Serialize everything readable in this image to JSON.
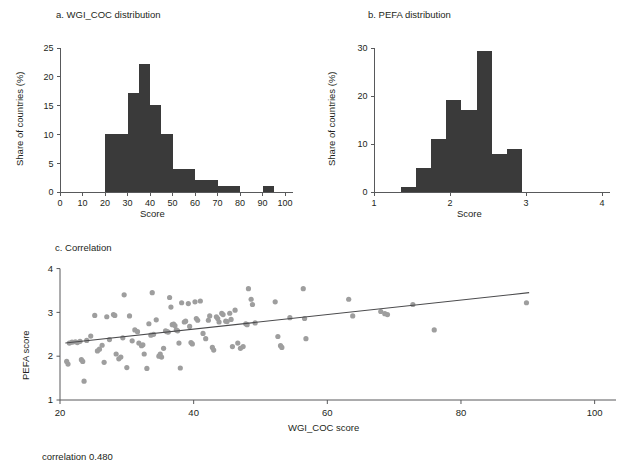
{
  "figure": {
    "caption": "correlation 0.480"
  },
  "panel_a": {
    "title": "a. WGI_COC distribution",
    "xlabel": "Score",
    "ylabel": "Share of countries (%)",
    "xticks": [
      "0",
      "10",
      "20",
      "30",
      "40",
      "50",
      "60",
      "70",
      "80",
      "90",
      "100"
    ],
    "yticks": [
      "0",
      "5",
      "10",
      "15",
      "20",
      "25"
    ]
  },
  "panel_b": {
    "title": "b. PEFA distribution",
    "xlabel": "Score",
    "ylabel": "Share of countries (%)",
    "xticks": [
      "1",
      "2",
      "3",
      "4"
    ],
    "yticks": [
      "0",
      "10",
      "20",
      "30"
    ]
  },
  "panel_c": {
    "title": "c. Correlation",
    "xlabel": "WGI_COC score",
    "ylabel": "PEFA score",
    "xticks": [
      "20",
      "40",
      "60",
      "80",
      "100"
    ],
    "yticks": [
      "1",
      "2",
      "3",
      "4"
    ]
  },
  "colors": {
    "bar": "#3a3a3a",
    "dot": "#9e9e9e",
    "line": "#4b4b4d",
    "axis": "#58595b",
    "text": "#231f20"
  },
  "chart_data": [
    {
      "type": "bar",
      "id": "a",
      "title": "a. WGI_COC distribution",
      "xlabel": "Score",
      "ylabel": "Share of countries (%)",
      "xlim": [
        0,
        100
      ],
      "ylim": [
        0,
        25
      ],
      "bin_width": 5,
      "grid": false,
      "bins": [
        {
          "x0": 20,
          "x1": 25,
          "value": 10.0
        },
        {
          "x0": 25,
          "x1": 30,
          "value": 10.0
        },
        {
          "x0": 30,
          "x1": 35,
          "value": 17.2
        },
        {
          "x0": 35,
          "x1": 40,
          "value": 22.2
        },
        {
          "x0": 40,
          "x1": 45,
          "value": 15.1
        },
        {
          "x0": 45,
          "x1": 50,
          "value": 10.0
        },
        {
          "x0": 50,
          "x1": 55,
          "value": 4.0
        },
        {
          "x0": 55,
          "x1": 60,
          "value": 4.0
        },
        {
          "x0": 60,
          "x1": 65,
          "value": 2.0
        },
        {
          "x0": 65,
          "x1": 70,
          "value": 2.0
        },
        {
          "x0": 70,
          "x1": 75,
          "value": 1.0
        },
        {
          "x0": 75,
          "x1": 80,
          "value": 1.0
        },
        {
          "x0": 90,
          "x1": 95,
          "value": 1.0
        }
      ]
    },
    {
      "type": "bar",
      "id": "b",
      "title": "b. PEFA distribution",
      "xlabel": "Score",
      "ylabel": "Share of countries (%)",
      "xlim": [
        1,
        4
      ],
      "ylim": [
        0,
        30
      ],
      "bin_width": 0.2,
      "grid": false,
      "bins": [
        {
          "x0": 1.35,
          "x1": 1.55,
          "value": 1.0
        },
        {
          "x0": 1.55,
          "x1": 1.75,
          "value": 5.0
        },
        {
          "x0": 1.75,
          "x1": 1.95,
          "value": 11.0
        },
        {
          "x0": 1.95,
          "x1": 2.15,
          "value": 19.2
        },
        {
          "x0": 2.15,
          "x1": 2.35,
          "value": 17.1
        },
        {
          "x0": 2.35,
          "x1": 2.55,
          "value": 29.3
        },
        {
          "x0": 2.55,
          "x1": 2.75,
          "value": 8.0
        },
        {
          "x0": 2.75,
          "x1": 2.95,
          "value": 9.0
        }
      ],
      "bins_note": "bars drawn between score 1.35 and 3.55 in steps of 0.2"
    },
    {
      "type": "scatter",
      "id": "c",
      "title": "c. Correlation",
      "xlabel": "WGI_COC score",
      "ylabel": "PEFA score",
      "xlim": [
        20,
        102
      ],
      "ylim": [
        1,
        4.15
      ],
      "grid": false,
      "annotation": "correlation 0.480",
      "correlation": 0.48,
      "fit_line": {
        "x": [
          20.8,
          90.2
        ],
        "y": [
          2.3,
          3.45
        ]
      },
      "points": [
        [
          21.0,
          1.88
        ],
        [
          21.2,
          1.82
        ],
        [
          21.4,
          2.3
        ],
        [
          21.8,
          2.32
        ],
        [
          22.3,
          2.33
        ],
        [
          22.6,
          2.31
        ],
        [
          23.0,
          2.34
        ],
        [
          23.2,
          1.92
        ],
        [
          23.4,
          1.88
        ],
        [
          23.6,
          1.43
        ],
        [
          24.0,
          2.36
        ],
        [
          24.6,
          2.46
        ],
        [
          25.2,
          2.93
        ],
        [
          25.6,
          2.12
        ],
        [
          25.9,
          2.16
        ],
        [
          26.3,
          2.25
        ],
        [
          26.6,
          1.86
        ],
        [
          27.0,
          2.9
        ],
        [
          27.4,
          2.38
        ],
        [
          28.0,
          2.95
        ],
        [
          28.2,
          2.93
        ],
        [
          28.4,
          2.05
        ],
        [
          28.8,
          1.94
        ],
        [
          29.1,
          1.98
        ],
        [
          29.4,
          2.42
        ],
        [
          29.6,
          3.4
        ],
        [
          30.0,
          1.74
        ],
        [
          30.4,
          2.92
        ],
        [
          30.8,
          2.35
        ],
        [
          31.2,
          2.6
        ],
        [
          31.6,
          2.56
        ],
        [
          31.8,
          2.3
        ],
        [
          32.2,
          2.24
        ],
        [
          32.4,
          2.26
        ],
        [
          32.6,
          2.05
        ],
        [
          33.0,
          1.72
        ],
        [
          33.3,
          2.74
        ],
        [
          33.6,
          2.48
        ],
        [
          33.8,
          3.45
        ],
        [
          34.0,
          2.5
        ],
        [
          34.4,
          2.83
        ],
        [
          34.8,
          2.0
        ],
        [
          35.0,
          2.05
        ],
        [
          35.2,
          1.98
        ],
        [
          35.5,
          2.18
        ],
        [
          35.8,
          2.58
        ],
        [
          36.0,
          2.56
        ],
        [
          36.2,
          2.55
        ],
        [
          36.4,
          3.34
        ],
        [
          36.6,
          3.12
        ],
        [
          36.8,
          2.72
        ],
        [
          37.0,
          2.73
        ],
        [
          37.2,
          2.7
        ],
        [
          37.4,
          2.6
        ],
        [
          37.6,
          2.58
        ],
        [
          37.8,
          2.3
        ],
        [
          38.0,
          1.73
        ],
        [
          38.2,
          3.22
        ],
        [
          38.6,
          2.78
        ],
        [
          38.8,
          2.8
        ],
        [
          39.2,
          3.2
        ],
        [
          39.4,
          2.68
        ],
        [
          39.6,
          2.31
        ],
        [
          39.8,
          2.28
        ],
        [
          40.2,
          3.24
        ],
        [
          40.4,
          2.86
        ],
        [
          40.6,
          2.82
        ],
        [
          41.0,
          3.26
        ],
        [
          41.4,
          2.52
        ],
        [
          41.8,
          2.4
        ],
        [
          42.2,
          2.82
        ],
        [
          42.4,
          2.92
        ],
        [
          42.8,
          2.2
        ],
        [
          43.0,
          2.14
        ],
        [
          43.4,
          2.9
        ],
        [
          43.6,
          2.86
        ],
        [
          43.8,
          2.78
        ],
        [
          44.2,
          2.98
        ],
        [
          44.4,
          2.95
        ],
        [
          44.8,
          2.8
        ],
        [
          45.0,
          2.79
        ],
        [
          45.4,
          2.98
        ],
        [
          45.6,
          2.84
        ],
        [
          45.8,
          2.22
        ],
        [
          46.2,
          3.05
        ],
        [
          46.6,
          2.3
        ],
        [
          47.0,
          2.18
        ],
        [
          47.4,
          2.22
        ],
        [
          47.8,
          2.74
        ],
        [
          48.0,
          2.72
        ],
        [
          48.2,
          3.54
        ],
        [
          48.6,
          3.3
        ],
        [
          48.8,
          3.18
        ],
        [
          49.2,
          2.76
        ],
        [
          52.2,
          3.24
        ],
        [
          52.6,
          2.45
        ],
        [
          53.0,
          2.24
        ],
        [
          53.2,
          2.2
        ],
        [
          54.4,
          2.88
        ],
        [
          56.4,
          3.54
        ],
        [
          56.6,
          2.86
        ],
        [
          56.8,
          2.4
        ],
        [
          63.2,
          3.3
        ],
        [
          63.8,
          2.92
        ],
        [
          68.0,
          3.02
        ],
        [
          68.6,
          2.97
        ],
        [
          69.0,
          2.95
        ],
        [
          72.8,
          3.18
        ],
        [
          76.0,
          2.6
        ],
        [
          89.8,
          3.22
        ]
      ]
    }
  ]
}
